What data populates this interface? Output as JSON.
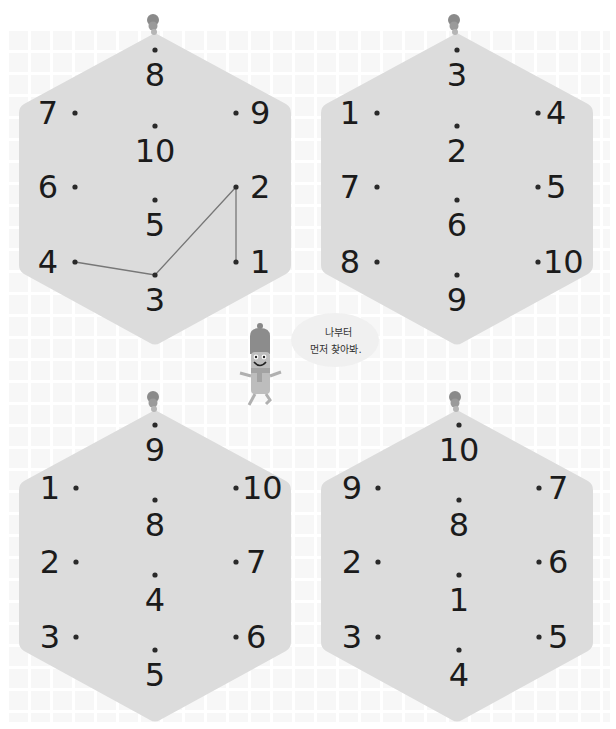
{
  "colors": {
    "hexagon_fill": "#dcdcdc",
    "dot": "#2a2a2a",
    "number": "#1b1b1b",
    "line": "#777777",
    "pin": "#8a8a8a",
    "background": "#ffffff"
  },
  "puzzles": [
    {
      "id": "top-left",
      "top": "8",
      "upper_left": "7",
      "upper_right": "9",
      "center_upper": "10",
      "middle_left": "6",
      "middle_right": "2",
      "center_lower": "5",
      "lower_left": "4",
      "lower_right": "1",
      "bottom": "3",
      "connected_path": [
        "1",
        "2",
        "3",
        "4"
      ]
    },
    {
      "id": "top-right",
      "top": "3",
      "upper_left": "1",
      "upper_right": "4",
      "center_upper": "2",
      "middle_left": "7",
      "middle_right": "5",
      "center_lower": "6",
      "lower_left": "8",
      "lower_right": "10",
      "bottom": "9"
    },
    {
      "id": "bottom-left",
      "top": "9",
      "upper_left": "1",
      "upper_right": "10",
      "center_upper": "8",
      "middle_left": "2",
      "middle_right": "7",
      "center_lower": "4",
      "lower_left": "3",
      "lower_right": "6",
      "bottom": "5"
    },
    {
      "id": "bottom-right",
      "top": "10",
      "upper_left": "9",
      "upper_right": "7",
      "center_upper": "8",
      "middle_left": "2",
      "middle_right": "6",
      "center_lower": "1",
      "lower_left": "3",
      "lower_right": "5",
      "bottom": "4"
    }
  ],
  "mascot": {
    "speech_line1": "나부터",
    "speech_line2": "먼저 찾아봐."
  }
}
